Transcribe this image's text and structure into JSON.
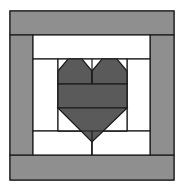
{
  "diagram": {
    "type": "quilt-block",
    "colors": {
      "border": "#8f8f8f",
      "heart": "#5a5a5a",
      "background": "#ffffff",
      "line": "#1a1a1a"
    },
    "regions": [
      {
        "name": "outer-border-top",
        "fill": "border"
      },
      {
        "name": "outer-border-bottom",
        "fill": "border"
      },
      {
        "name": "outer-border-left",
        "fill": "border"
      },
      {
        "name": "outer-border-right",
        "fill": "border"
      },
      {
        "name": "inner-strip-top",
        "fill": "background"
      },
      {
        "name": "inner-strip-bottom",
        "fill": "background"
      },
      {
        "name": "inner-strip-left",
        "fill": "background"
      },
      {
        "name": "inner-strip-right",
        "fill": "background"
      },
      {
        "name": "heart-top-lobes",
        "fill": "heart"
      },
      {
        "name": "heart-middle-row",
        "fill": "heart"
      },
      {
        "name": "heart-bottom-point",
        "fill": "heart"
      }
    ]
  }
}
